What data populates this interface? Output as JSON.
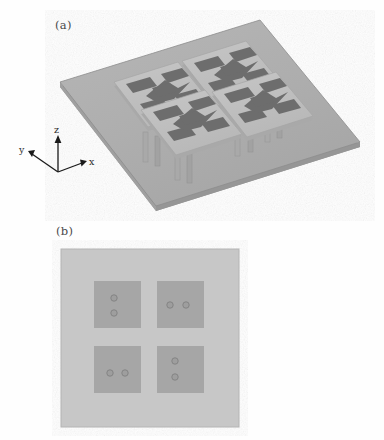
{
  "figure": {
    "kind": "technical-illustration",
    "background_color": "#fefefe",
    "panels": [
      {
        "id": "a",
        "label": "(a)",
        "view": "3D perspective view of the 2x2 antenna array on a tilted square ground plane",
        "axes": {
          "origin_label": "",
          "labels": [
            "z",
            "y",
            "x"
          ],
          "z_label": "z",
          "y_label": "y",
          "x_label": "x",
          "arrow_color": "#1a1a1a"
        },
        "ground_plane": {
          "color": "#b0b0b0",
          "edge_color": "#8f8f8f",
          "side_color": "#9a9a9a"
        },
        "element_count": 4,
        "element": {
          "substrate_color": "#c0c0c0",
          "patch_color": "#6e6e6e",
          "post_color": "#a8a8a8",
          "arms_per_element": 4,
          "center_shape": "bowtie"
        }
      },
      {
        "id": "b",
        "label": "(b)",
        "view": "Plan view of the ground plane showing four square patches with feed vias",
        "board": {
          "color": "#c7c7c7",
          "border_color": "#b3b3b3"
        },
        "patches": [
          {
            "name": "patch-top-left",
            "color": "#a6a6a6",
            "via_arrangement": "vertical",
            "via_count": 2
          },
          {
            "name": "patch-top-right",
            "color": "#a6a6a6",
            "via_arrangement": "horizontal",
            "via_count": 2
          },
          {
            "name": "patch-bottom-left",
            "color": "#a6a6a6",
            "via_arrangement": "horizontal",
            "via_count": 2
          },
          {
            "name": "patch-bottom-right",
            "color": "#a6a6a6",
            "via_arrangement": "vertical",
            "via_count": 2
          }
        ],
        "via": {
          "ring_color": "#8a8a8a",
          "fill_color": "#9e9e9e",
          "radius_px": 3
        }
      }
    ]
  }
}
